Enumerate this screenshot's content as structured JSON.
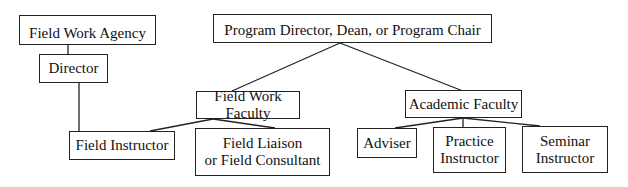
{
  "diagram": {
    "type": "organizational-chart",
    "nodes": [
      {
        "id": "agency",
        "label": "Field Work Agency"
      },
      {
        "id": "director",
        "label": "Director"
      },
      {
        "id": "program",
        "label": "Program Director, Dean, or Program Chair"
      },
      {
        "id": "fwfaculty",
        "label": "Field Work Faculty"
      },
      {
        "id": "academic",
        "label": "Academic Faculty"
      },
      {
        "id": "instructor",
        "label": "Field Instructor"
      },
      {
        "id": "liaison",
        "label": "Field Liaison\nor Field Consultant"
      },
      {
        "id": "adviser",
        "label": "Adviser"
      },
      {
        "id": "practice",
        "label": "Practice\nInstructor"
      },
      {
        "id": "seminar",
        "label": "Seminar\nInstructor"
      }
    ],
    "edges": [
      [
        "agency",
        "director"
      ],
      [
        "director",
        "instructor"
      ],
      [
        "program",
        "fwfaculty"
      ],
      [
        "program",
        "academic"
      ],
      [
        "fwfaculty",
        "instructor"
      ],
      [
        "fwfaculty",
        "liaison"
      ],
      [
        "academic",
        "adviser"
      ],
      [
        "academic",
        "practice"
      ],
      [
        "academic",
        "seminar"
      ]
    ]
  }
}
